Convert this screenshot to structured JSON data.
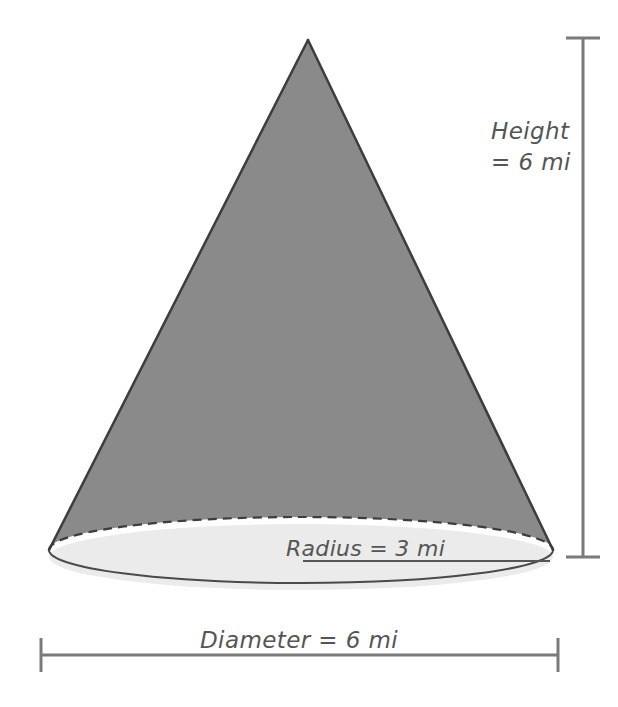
{
  "figure": {
    "type": "cone-geometry-diagram",
    "shape_name": "cone",
    "background_color": "#ffffff"
  },
  "colors": {
    "cone_body_fill": "#8a8a8a",
    "cone_outline": "#3d3d3d",
    "base_ellipse_fill": "#ebebeb",
    "base_ellipse_outline": "#4a4a4a",
    "hidden_edge_dashed": "#3d3d3d",
    "measure_bar": "#7a7a7a",
    "label_text": "#555555",
    "radius_line": "#555555"
  },
  "labels": {
    "height_line1": "Height",
    "height_line2": "= 6 mi",
    "radius": "Radius = 3 mi",
    "diameter": "Diameter = 6 mi"
  },
  "measurements": {
    "height_value": 6,
    "height_unit": "mi",
    "radius_value": 3,
    "radius_unit": "mi",
    "diameter_value": 6,
    "diameter_unit": "mi"
  },
  "geometry": {
    "apex_x": 308,
    "apex_y": 40,
    "base_center_x": 301,
    "base_center_y": 557,
    "base_radius_x": 252,
    "base_radius_y": 33,
    "left_tangent_x": 49,
    "left_tangent_y": 550,
    "right_tangent_x": 553,
    "right_tangent_y": 550,
    "height_bar_x": 583,
    "height_bar_top_y": 38,
    "height_bar_bottom_y": 557,
    "diameter_bar_y": 655,
    "diameter_bar_left_x": 41,
    "diameter_bar_right_x": 558,
    "radius_line_y": 561,
    "radius_line_left_x": 303,
    "radius_line_right_x": 550
  }
}
